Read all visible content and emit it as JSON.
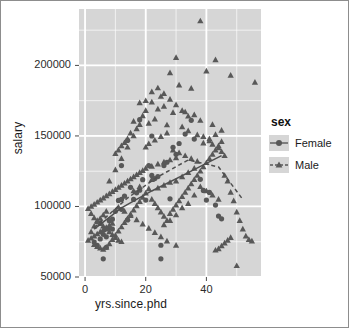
{
  "chart_data": {
    "type": "scatter",
    "title": "",
    "xlabel": "yrs.since.phd",
    "ylabel": "salary",
    "xlim": [
      -2,
      58
    ],
    "ylim": [
      50000,
      240000
    ],
    "xticks": [
      0,
      20,
      40
    ],
    "xtick_labels": [
      "0",
      "20",
      "40"
    ],
    "yticks": [
      50000,
      100000,
      150000,
      200000
    ],
    "ytick_labels": [
      "50000",
      "100000",
      "150000",
      "200000"
    ],
    "grid": true,
    "grid_color": "#ffffff",
    "panel_background": "#d6d6d6",
    "marker_color": "#585858",
    "legend": {
      "title": "sex",
      "position": "right",
      "entries": [
        {
          "label": "Female",
          "marker": "circle",
          "line": "solid"
        },
        {
          "label": "Male",
          "marker": "triangle",
          "line": "dashed"
        }
      ]
    },
    "series": [
      {
        "name": "Female",
        "marker": "circle",
        "trendline": "solid",
        "points": [
          [
            3,
            74830
          ],
          [
            4,
            72500
          ],
          [
            5,
            77000
          ],
          [
            6,
            62884
          ],
          [
            6,
            80225
          ],
          [
            7,
            71065
          ],
          [
            8,
            89942
          ],
          [
            8,
            85000
          ],
          [
            9,
            91000
          ],
          [
            10,
            96545
          ],
          [
            11,
            104279
          ],
          [
            12,
            105000
          ],
          [
            12,
            98000
          ],
          [
            13,
            107309
          ],
          [
            14,
            90450
          ],
          [
            15,
            113543
          ],
          [
            16,
            105000
          ],
          [
            17,
            109650
          ],
          [
            18,
            111512
          ],
          [
            19,
            119015
          ],
          [
            20,
            104542
          ],
          [
            21,
            129000
          ],
          [
            22,
            122000
          ],
          [
            23,
            119800
          ],
          [
            24,
            121200
          ],
          [
            25,
            62884
          ],
          [
            25,
            72500
          ],
          [
            26,
            129000
          ],
          [
            27,
            131350
          ],
          [
            28,
            105450
          ],
          [
            29,
            142000
          ],
          [
            30,
            137000
          ],
          [
            31,
            144651
          ],
          [
            33,
            151292
          ],
          [
            35,
            161101
          ],
          [
            36,
            147765
          ],
          [
            38,
            119250
          ],
          [
            39,
            111350
          ],
          [
            40,
            104542
          ],
          [
            41,
            109954
          ],
          [
            43,
            101000
          ],
          [
            44,
            93164
          ],
          [
            45,
            91227
          ],
          [
            18,
            161542
          ],
          [
            22,
            149962
          ],
          [
            14,
            146856
          ],
          [
            12,
            129000
          ],
          [
            9,
            84000
          ],
          [
            7,
            78500
          ],
          [
            5,
            88000
          ]
        ]
      },
      {
        "name": "Male",
        "marker": "triangle",
        "trendline": "dashed",
        "points": [
          [
            38,
            231545
          ],
          [
            30,
            205500
          ],
          [
            43,
            204000
          ],
          [
            28,
            194800
          ],
          [
            40,
            196000
          ],
          [
            48,
            193000
          ],
          [
            56,
            188000
          ],
          [
            31,
            186000
          ],
          [
            35,
            183800
          ],
          [
            22,
            181257
          ],
          [
            20,
            175000
          ],
          [
            25,
            178000
          ],
          [
            18,
            173500
          ],
          [
            26,
            171000
          ],
          [
            24,
            169000
          ],
          [
            33,
            167000
          ],
          [
            29,
            166500
          ],
          [
            36,
            165000
          ],
          [
            19,
            164200
          ],
          [
            23,
            162000
          ],
          [
            16,
            160400
          ],
          [
            21,
            159000
          ],
          [
            27,
            157800
          ],
          [
            32,
            156500
          ],
          [
            17,
            155000
          ],
          [
            34,
            153600
          ],
          [
            15,
            152000
          ],
          [
            37,
            150800
          ],
          [
            39,
            149500
          ],
          [
            14,
            148000
          ],
          [
            41,
            146500
          ],
          [
            13,
            145200
          ],
          [
            42,
            144000
          ],
          [
            12,
            143000
          ],
          [
            44,
            141500
          ],
          [
            11,
            140000
          ],
          [
            45,
            138800
          ],
          [
            10,
            137500
          ],
          [
            46,
            136000
          ],
          [
            30,
            134500
          ],
          [
            28,
            133000
          ],
          [
            26,
            131500
          ],
          [
            24,
            130000
          ],
          [
            22,
            128500
          ],
          [
            20,
            127000
          ],
          [
            19,
            125500
          ],
          [
            18,
            124000
          ],
          [
            17,
            122500
          ],
          [
            16,
            121000
          ],
          [
            15,
            119500
          ],
          [
            14,
            118000
          ],
          [
            13,
            116500
          ],
          [
            12,
            115000
          ],
          [
            11,
            113500
          ],
          [
            10,
            112000
          ],
          [
            9,
            110500
          ],
          [
            8,
            109000
          ],
          [
            7,
            107500
          ],
          [
            6,
            106000
          ],
          [
            5,
            104500
          ],
          [
            4,
            103000
          ],
          [
            3,
            101500
          ],
          [
            2,
            100000
          ],
          [
            1,
            98500
          ],
          [
            2,
            95000
          ],
          [
            3,
            92000
          ],
          [
            4,
            90000
          ],
          [
            5,
            88000
          ],
          [
            6,
            86000
          ],
          [
            7,
            84000
          ],
          [
            8,
            82000
          ],
          [
            9,
            80000
          ],
          [
            10,
            78000
          ],
          [
            11,
            76000
          ],
          [
            12,
            75000
          ],
          [
            3,
            73000
          ],
          [
            4,
            71500
          ],
          [
            5,
            70500
          ],
          [
            6,
            69500
          ],
          [
            7,
            71000
          ],
          [
            8,
            73500
          ],
          [
            9,
            76500
          ],
          [
            10,
            79500
          ],
          [
            11,
            82500
          ],
          [
            12,
            85500
          ],
          [
            13,
            88500
          ],
          [
            14,
            91500
          ],
          [
            15,
            94500
          ],
          [
            16,
            97500
          ],
          [
            17,
            100500
          ],
          [
            18,
            103500
          ],
          [
            19,
            106500
          ],
          [
            20,
            109500
          ],
          [
            21,
            112500
          ],
          [
            22,
            105000
          ],
          [
            23,
            102000
          ],
          [
            24,
            99000
          ],
          [
            25,
            96000
          ],
          [
            26,
            93000
          ],
          [
            27,
            90000
          ],
          [
            28,
            95000
          ],
          [
            29,
            98000
          ],
          [
            30,
            101000
          ],
          [
            31,
            104000
          ],
          [
            32,
            107000
          ],
          [
            33,
            110000
          ],
          [
            34,
            113000
          ],
          [
            35,
            116000
          ],
          [
            36,
            119000
          ],
          [
            37,
            122000
          ],
          [
            38,
            125000
          ],
          [
            39,
            128000
          ],
          [
            40,
            131000
          ],
          [
            41,
            134000
          ],
          [
            42,
            137000
          ],
          [
            43,
            140000
          ],
          [
            44,
            143000
          ],
          [
            45,
            146000
          ],
          [
            46,
            122000
          ],
          [
            47,
            118000
          ],
          [
            48,
            110000
          ],
          [
            49,
            104000
          ],
          [
            50,
            96000
          ],
          [
            51,
            90000
          ],
          [
            52,
            84000
          ],
          [
            53,
            79000
          ],
          [
            54,
            76500
          ],
          [
            55,
            75500
          ],
          [
            50,
            58000
          ],
          [
            45,
            72000
          ],
          [
            44,
            70000
          ],
          [
            43,
            69000
          ],
          [
            46,
            74000
          ],
          [
            47,
            76000
          ],
          [
            48,
            78000
          ],
          [
            30,
            72500
          ],
          [
            27,
            75500
          ],
          [
            25,
            78500
          ],
          [
            23,
            81500
          ],
          [
            21,
            84500
          ],
          [
            19,
            87500
          ],
          [
            17,
            90500
          ],
          [
            15,
            93500
          ],
          [
            13,
            96500
          ],
          [
            11,
            99500
          ],
          [
            9,
            88000
          ],
          [
            8,
            86500
          ],
          [
            7,
            85000
          ],
          [
            6,
            83500
          ],
          [
            5,
            82000
          ],
          [
            4,
            80500
          ],
          [
            3,
            79000
          ],
          [
            2,
            77500
          ],
          [
            1,
            76000
          ],
          [
            2,
            82000
          ],
          [
            3,
            86000
          ],
          [
            4,
            89000
          ],
          [
            5,
            91500
          ],
          [
            6,
            94000
          ],
          [
            7,
            96500
          ],
          [
            20,
            142000
          ],
          [
            21,
            144500
          ],
          [
            23,
            147000
          ],
          [
            25,
            149500
          ],
          [
            27,
            152000
          ],
          [
            29,
            140000
          ],
          [
            31,
            138000
          ],
          [
            33,
            136000
          ],
          [
            35,
            134000
          ],
          [
            37,
            132000
          ],
          [
            39,
            145000
          ],
          [
            41,
            148000
          ],
          [
            43,
            151000
          ],
          [
            45,
            154000
          ],
          [
            42,
            158000
          ],
          [
            38,
            161000
          ],
          [
            34,
            164000
          ],
          [
            32,
            168000
          ],
          [
            30,
            172000
          ],
          [
            28,
            176000
          ],
          [
            26,
            180000
          ],
          [
            24,
            184000
          ],
          [
            22,
            174000
          ],
          [
            20,
            168000
          ],
          [
            18,
            158000
          ],
          [
            16,
            150000
          ],
          [
            14,
            142000
          ],
          [
            12,
            134000
          ],
          [
            10,
            126000
          ],
          [
            8,
            118000
          ],
          [
            24,
            113000
          ],
          [
            26,
            115000
          ],
          [
            28,
            117000
          ],
          [
            36,
            127000
          ],
          [
            34,
            124000
          ],
          [
            32,
            121000
          ],
          [
            30,
            118000
          ],
          [
            16,
            111000
          ],
          [
            18,
            114000
          ],
          [
            22,
            119000
          ],
          [
            44,
            105000
          ],
          [
            42,
            108000
          ],
          [
            40,
            111000
          ],
          [
            38,
            114000
          ],
          [
            36,
            108000
          ],
          [
            34,
            102000
          ],
          [
            32,
            99000
          ],
          [
            30,
            94000
          ],
          [
            28,
            90000
          ],
          [
            26,
            87000
          ]
        ]
      }
    ],
    "female_trend": [
      [
        3,
        84000
      ],
      [
        12,
        99000
      ],
      [
        22,
        111000
      ],
      [
        34,
        124000
      ],
      [
        45,
        136000
      ]
    ],
    "male_trend": [
      [
        3,
        85000
      ],
      [
        14,
        106000
      ],
      [
        24,
        121000
      ],
      [
        34,
        133000
      ],
      [
        44,
        128000
      ],
      [
        52,
        105000
      ]
    ]
  },
  "xlabel": "yrs.since.phd",
  "ylabel": "salary",
  "legend": {
    "title": "sex",
    "female": "Female",
    "male": "Male"
  },
  "xtick_labels": [
    "0",
    "20",
    "40"
  ],
  "ytick_labels": [
    "200000",
    "150000",
    "100000",
    "50000"
  ]
}
